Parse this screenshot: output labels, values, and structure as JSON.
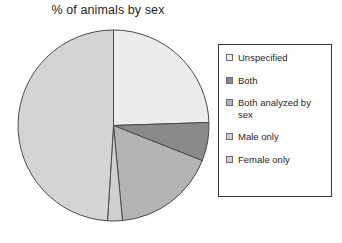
{
  "chart_data": {
    "type": "pie",
    "title": "% of animals by sex",
    "xlabel": "",
    "ylabel": "",
    "legend_position": "right",
    "grid": false,
    "categories": [
      "Unspecified",
      "Both",
      "Both analyzed by sex",
      "Male only",
      "Female only"
    ],
    "values": [
      24.5,
      6.5,
      17.5,
      2.5,
      49.0
    ],
    "units": "%",
    "start_angle_deg": 90,
    "direction": "clockwise",
    "slices": [
      {
        "label": "Unspecified",
        "value": 24.5,
        "color": "#ececec",
        "start_deg": 0,
        "end_deg": 88.2
      },
      {
        "label": "Both",
        "value": 6.5,
        "color": "#8a8a8a",
        "start_deg": 88.2,
        "end_deg": 111.6
      },
      {
        "label": "Both analyzed by sex",
        "value": 17.5,
        "color": "#b4b4b4",
        "start_deg": 111.6,
        "end_deg": 174.6
      },
      {
        "label": "Male only",
        "value": 2.5,
        "color": "#cfcfcf",
        "start_deg": 174.6,
        "end_deg": 183.6
      },
      {
        "label": "Female only",
        "value": 49.0,
        "color": "#d4d4d4",
        "start_deg": 183.6,
        "end_deg": 360
      }
    ]
  },
  "title": {
    "text": "% of animals by sex"
  },
  "legend": {
    "items": [
      {
        "label": "Unspecified",
        "swatch_color": "#ececec"
      },
      {
        "label": "Both",
        "swatch_color": "#8a8a8a"
      },
      {
        "label": "Both analyzed by sex",
        "swatch_color": "#b4b4b4"
      },
      {
        "label": "Male only",
        "swatch_color": "#cfcfcf"
      },
      {
        "label": "Female only",
        "swatch_color": "#d4d4d4"
      }
    ]
  },
  "style": {
    "slice_outline": "#4a4a4a",
    "legend_border": "#3a3a3a",
    "background": "#ffffff",
    "text_color": "#1f1f1f"
  }
}
